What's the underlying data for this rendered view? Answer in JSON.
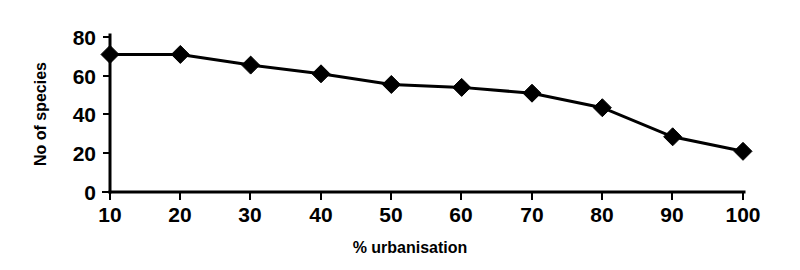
{
  "chart_data": {
    "type": "line",
    "title": "",
    "subtitle": "",
    "xlabel": "% urbanisation",
    "ylabel": "No of species",
    "x": [
      10,
      20,
      30,
      40,
      50,
      60,
      70,
      80,
      90,
      100
    ],
    "values": [
      71,
      71,
      65.5,
      61,
      55.5,
      54,
      51,
      43.5,
      28.5,
      21
    ],
    "series": [
      {
        "name": "No of species",
        "values": [
          71,
          71,
          65.5,
          61,
          55.5,
          54,
          51,
          43.5,
          28.5,
          21
        ]
      }
    ],
    "xtick_labels": [
      "10",
      "20",
      "30",
      "40",
      "50",
      "60",
      "70",
      "80",
      "90",
      "100"
    ],
    "ytick_labels": [
      "0",
      "20",
      "40",
      "60",
      "80"
    ],
    "ytick_values": [
      0,
      20,
      40,
      60,
      80
    ],
    "xlim": [
      10,
      100
    ],
    "ylim": [
      0,
      80
    ],
    "grid": false,
    "legend": false,
    "legend_position": "none",
    "marker": "filled-diamond",
    "line_color": "#000000",
    "marker_color": "#000000",
    "background_color": "#ffffff",
    "annotations": []
  },
  "axes": {
    "y_title": "No of species",
    "x_title": "% urbanisation"
  }
}
